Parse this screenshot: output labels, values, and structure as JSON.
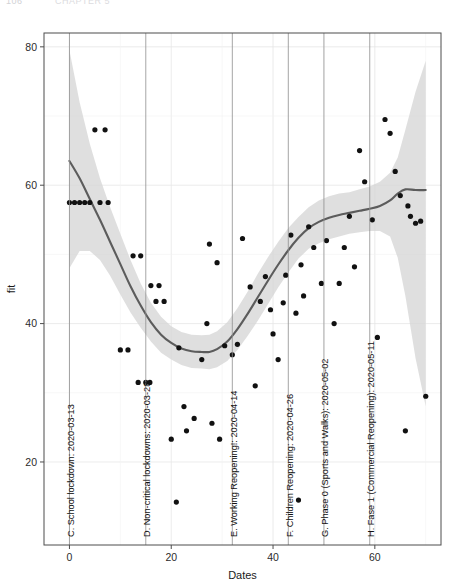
{
  "page": {
    "header_artifact_number": "106",
    "header_artifact_text": "CHAPTER 5"
  },
  "chart_data": {
    "type": "scatter",
    "title": "",
    "xlabel": "Dates",
    "ylabel": "fit",
    "xlim": [
      -5,
      73
    ],
    "ylim": [
      8,
      82
    ],
    "xticks": [
      0,
      20,
      40,
      60
    ],
    "xtick_labels": [
      "0",
      "20",
      "40",
      "60"
    ],
    "yticks": [
      20,
      40,
      60,
      80
    ],
    "ytick_labels": [
      "20",
      "40",
      "60",
      "80"
    ],
    "grid": true,
    "legend": "none",
    "smoother": "loess with 95% confidence ribbon",
    "smooth_line_color": "#5c5c5c",
    "ribbon_color": "#d4d4d4",
    "point_color": "#111111",
    "points": [
      [
        0,
        57.5
      ],
      [
        1,
        57.5
      ],
      [
        2,
        57.5
      ],
      [
        3,
        57.5
      ],
      [
        4,
        57.5
      ],
      [
        5,
        68.0
      ],
      [
        7,
        68.0
      ],
      [
        6,
        57.5
      ],
      [
        7.6,
        57.5
      ],
      [
        10,
        36.2
      ],
      [
        11.5,
        36.2
      ],
      [
        12.5,
        49.8
      ],
      [
        14,
        49.8
      ],
      [
        13.5,
        31.5
      ],
      [
        15,
        31.5
      ],
      [
        15.8,
        31.5
      ],
      [
        16,
        45.5
      ],
      [
        17.6,
        45.5
      ],
      [
        17,
        43.2
      ],
      [
        18.6,
        43.2
      ],
      [
        20,
        23.3
      ],
      [
        21,
        14.2
      ],
      [
        21.5,
        36.5
      ],
      [
        22.5,
        28.0
      ],
      [
        23,
        24.5
      ],
      [
        24.5,
        26.3
      ],
      [
        26,
        34.8
      ],
      [
        27,
        40.0
      ],
      [
        28,
        25.6
      ],
      [
        29.5,
        23.3
      ],
      [
        27.5,
        51.5
      ],
      [
        29,
        48.8
      ],
      [
        30.5,
        36.8
      ],
      [
        32,
        35.5
      ],
      [
        33,
        37.0
      ],
      [
        34,
        52.3
      ],
      [
        35.5,
        45.3
      ],
      [
        36.5,
        31.0
      ],
      [
        37.5,
        43.2
      ],
      [
        38.5,
        46.8
      ],
      [
        39.5,
        42.0
      ],
      [
        40,
        38.5
      ],
      [
        41,
        34.8
      ],
      [
        42,
        43.0
      ],
      [
        42.5,
        47.0
      ],
      [
        43.5,
        52.8
      ],
      [
        44.5,
        41.5
      ],
      [
        45,
        14.5
      ],
      [
        45.5,
        48.5
      ],
      [
        46,
        44.0
      ],
      [
        47,
        54.0
      ],
      [
        48,
        51.0
      ],
      [
        49.5,
        45.8
      ],
      [
        50.5,
        52.0
      ],
      [
        52,
        40.0
      ],
      [
        53,
        45.8
      ],
      [
        54,
        51.0
      ],
      [
        55,
        55.5
      ],
      [
        56,
        48.2
      ],
      [
        57,
        65.0
      ],
      [
        58,
        60.5
      ],
      [
        59.5,
        55.0
      ],
      [
        60.5,
        38.0
      ],
      [
        62,
        69.5
      ],
      [
        63,
        67.5
      ],
      [
        64,
        62.0
      ],
      [
        65,
        58.5
      ],
      [
        66.5,
        57.0
      ],
      [
        67,
        55.5
      ],
      [
        68,
        54.5
      ],
      [
        69,
        54.8
      ],
      [
        70,
        29.5
      ],
      [
        66,
        24.5
      ]
    ],
    "fit_curve": [
      [
        0,
        63.5
      ],
      [
        2,
        61.0
      ],
      [
        4,
        58.0
      ],
      [
        6,
        55.0
      ],
      [
        8,
        51.8
      ],
      [
        10,
        48.6
      ],
      [
        12,
        45.4
      ],
      [
        14,
        42.6
      ],
      [
        16,
        40.2
      ],
      [
        18,
        38.4
      ],
      [
        20,
        37.2
      ],
      [
        22,
        36.4
      ],
      [
        24,
        36.0
      ],
      [
        26,
        35.9
      ],
      [
        27.5,
        35.9
      ],
      [
        29,
        36.3
      ],
      [
        31,
        37.4
      ],
      [
        33,
        39.2
      ],
      [
        35,
        41.4
      ],
      [
        37,
        43.8
      ],
      [
        39,
        46.2
      ],
      [
        41,
        48.5
      ],
      [
        43,
        50.6
      ],
      [
        45,
        52.4
      ],
      [
        47,
        53.8
      ],
      [
        49,
        54.7
      ],
      [
        51,
        55.3
      ],
      [
        53,
        55.7
      ],
      [
        55,
        56.0
      ],
      [
        57,
        56.3
      ],
      [
        59,
        56.6
      ],
      [
        61,
        57.0
      ],
      [
        63,
        57.8
      ],
      [
        64.5,
        58.8
      ],
      [
        66,
        59.4
      ],
      [
        68,
        59.3
      ],
      [
        70,
        59.3
      ]
    ],
    "ribbon_upper": [
      [
        0,
        79.5
      ],
      [
        2,
        72.0
      ],
      [
        4,
        66.0
      ],
      [
        6,
        61.0
      ],
      [
        8,
        56.8
      ],
      [
        10,
        53.0
      ],
      [
        12,
        49.2
      ],
      [
        14,
        45.8
      ],
      [
        16,
        43.0
      ],
      [
        18,
        41.0
      ],
      [
        20,
        39.6
      ],
      [
        22,
        38.8
      ],
      [
        24,
        38.4
      ],
      [
        26,
        38.3
      ],
      [
        27.5,
        38.4
      ],
      [
        29,
        38.9
      ],
      [
        31,
        40.2
      ],
      [
        33,
        42.2
      ],
      [
        35,
        44.6
      ],
      [
        37,
        47.2
      ],
      [
        39,
        49.6
      ],
      [
        41,
        51.8
      ],
      [
        43,
        53.8
      ],
      [
        45,
        55.4
      ],
      [
        47,
        56.8
      ],
      [
        49,
        57.8
      ],
      [
        51,
        58.4
      ],
      [
        53,
        58.8
      ],
      [
        55,
        59.0
      ],
      [
        57,
        59.4
      ],
      [
        59,
        59.8
      ],
      [
        61,
        60.5
      ],
      [
        63,
        61.8
      ],
      [
        64.5,
        64.0
      ],
      [
        66,
        68.0
      ],
      [
        68,
        73.5
      ],
      [
        70,
        78.0
      ]
    ],
    "ribbon_lower": [
      [
        0,
        48.0
      ],
      [
        2,
        50.5
      ],
      [
        4,
        50.5
      ],
      [
        6,
        49.2
      ],
      [
        8,
        46.9
      ],
      [
        10,
        44.2
      ],
      [
        12,
        41.6
      ],
      [
        14,
        39.4
      ],
      [
        16,
        37.4
      ],
      [
        18,
        35.8
      ],
      [
        20,
        34.8
      ],
      [
        22,
        34.0
      ],
      [
        24,
        33.6
      ],
      [
        26,
        33.5
      ],
      [
        27.5,
        33.4
      ],
      [
        29,
        33.7
      ],
      [
        31,
        34.6
      ],
      [
        33,
        36.2
      ],
      [
        35,
        38.2
      ],
      [
        37,
        40.4
      ],
      [
        39,
        42.8
      ],
      [
        41,
        45.2
      ],
      [
        43,
        47.4
      ],
      [
        45,
        49.4
      ],
      [
        47,
        50.8
      ],
      [
        49,
        51.6
      ],
      [
        51,
        52.2
      ],
      [
        53,
        52.6
      ],
      [
        55,
        53.0
      ],
      [
        57,
        53.2
      ],
      [
        59,
        53.4
      ],
      [
        61,
        53.4
      ],
      [
        63,
        52.6
      ],
      [
        64.5,
        49.5
      ],
      [
        66,
        44.0
      ],
      [
        68,
        35.0
      ],
      [
        70,
        28.0
      ]
    ],
    "reference_lines": [
      {
        "id": "C",
        "x": 0,
        "label": "C. School lockdown: 2020-03-13"
      },
      {
        "id": "D",
        "x": 15,
        "label": "D. Non-critical lockdowns: 2020-03-28"
      },
      {
        "id": "E",
        "x": 32,
        "label": "E. Working Reopening!: 2020-04-14"
      },
      {
        "id": "F",
        "x": 43,
        "label": "F. Children Reopening: 2020-04-26"
      },
      {
        "id": "G",
        "x": 50,
        "label": "G. Phase 0 (Sports and Walks): 2020-05-02"
      },
      {
        "id": "H",
        "x": 59,
        "label": "H. Fase 1 (Commercial Reopening): 2020-05-11"
      }
    ]
  }
}
